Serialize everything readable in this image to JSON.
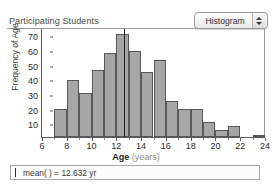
{
  "header": {
    "plot_title": "Participating Students",
    "plot_type_select": {
      "value": "Histogram",
      "stepper_up_icon": "triangle-up-icon",
      "stepper_down_icon": "triangle-down-icon"
    }
  },
  "statusbar": {
    "caret_icon": "text-caret-icon",
    "text": "mean(  ) = 12.632 yr"
  },
  "chart_data": {
    "type": "bar",
    "title": "Participating Students",
    "xlabel": "Age (years)",
    "xlabel_main": "Age",
    "xlabel_unit": "(years)",
    "ylabel": "Frequency of Age",
    "xlim": [
      6,
      24
    ],
    "ylim": [
      0,
      73
    ],
    "grid": false,
    "legend": "none",
    "bin_width": 1,
    "xticks": [
      6,
      8,
      10,
      12,
      14,
      16,
      18,
      20,
      22,
      24
    ],
    "xtick_labels": [
      "6",
      "8",
      "10",
      "12",
      "14",
      "16",
      "18",
      "20",
      "22",
      "24"
    ],
    "yticks": [
      10,
      20,
      30,
      40,
      50,
      60,
      70
    ],
    "ytick_labels": [
      "10",
      "20",
      "30",
      "40",
      "50",
      "60",
      "70"
    ],
    "bins": [
      {
        "x0": 7,
        "x1": 8,
        "value": 19
      },
      {
        "x0": 8,
        "x1": 9,
        "value": 38.5
      },
      {
        "x0": 9,
        "x1": 10,
        "value": 30
      },
      {
        "x0": 10,
        "x1": 11,
        "value": 45
      },
      {
        "x0": 11,
        "x1": 12,
        "value": 57
      },
      {
        "x0": 12,
        "x1": 13,
        "value": 69.5
      },
      {
        "x0": 13,
        "x1": 14,
        "value": 58
      },
      {
        "x0": 14,
        "x1": 15,
        "value": 44
      },
      {
        "x0": 15,
        "x1": 16,
        "value": 52
      },
      {
        "x0": 16,
        "x1": 17,
        "value": 24.5
      },
      {
        "x0": 17,
        "x1": 18,
        "value": 19
      },
      {
        "x0": 18,
        "x1": 19,
        "value": 19
      },
      {
        "x0": 19,
        "x1": 20,
        "value": 10
      },
      {
        "x0": 20,
        "x1": 21,
        "value": 5
      },
      {
        "x0": 21,
        "x1": 22,
        "value": 7.5
      },
      {
        "x0": 23,
        "x1": 24,
        "value": 1
      }
    ],
    "annotations": [
      {
        "name": "mean-line",
        "type": "vline",
        "x": 12.632,
        "label": "mean = 12.632 yr"
      }
    ],
    "colors": {
      "bar_fill": "#a6a6a6",
      "bar_edge": "#585858",
      "axis": "#5a5a5a",
      "mean_line": "#1c1c1c"
    }
  }
}
